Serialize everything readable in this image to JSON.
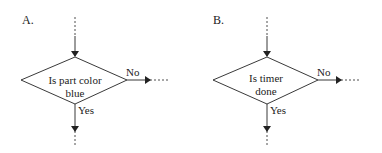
{
  "diagrams": [
    {
      "label": "A.",
      "decision_line1": "Is part color",
      "decision_line2": "blue",
      "no_label": "No",
      "yes_label": "Yes"
    },
    {
      "label": "B.",
      "decision_line1": "Is timer",
      "decision_line2": "done",
      "no_label": "No",
      "yes_label": "Yes"
    }
  ],
  "colors": {
    "stroke": "#222222",
    "background": "#ffffff"
  }
}
